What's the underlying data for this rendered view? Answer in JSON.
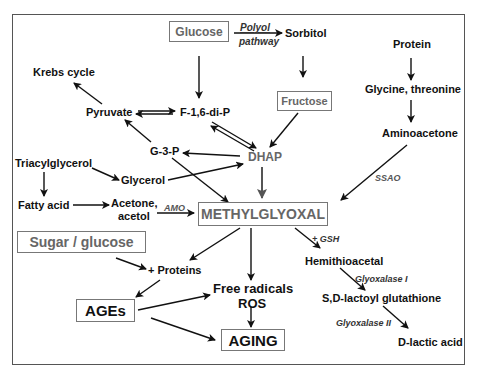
{
  "diagram": {
    "nodes": {
      "glucose": "Glucose",
      "polyol": "Polyol",
      "pathway": "pathway",
      "sorbitol": "Sorbitol",
      "protein": "Protein",
      "krebs": "Krebs cycle",
      "pyruvate": "Pyruvate",
      "f16dip": "F-1,6-di-P",
      "glycine": "Glycine, threonine",
      "fructose": "Fructose",
      "aminoacetone": "Aminoacetone",
      "g3p": "G-3-P",
      "dhap": "DHAP",
      "triacylglycerol": "Triacylglycerol",
      "glycerol": "Glycerol",
      "ssao": "SSAO",
      "fatty_acid": "Fatty acid",
      "acetone": "Acetone,",
      "acetol": "acetol",
      "amo": "AMO",
      "methylglyoxal": "METHYLGLYOXAL",
      "gsh": "+ GSH",
      "sugar_glucose": "Sugar / glucose",
      "hemithioacetal": "Hemithioacetal",
      "proteins": "+ Proteins",
      "free_radicals": "Free radicals",
      "ros": "ROS",
      "glyoxalase1": "Glyoxalase I",
      "ages": "AGEs",
      "sd_lactoyl": "S,D-lactoyl glutathione",
      "glyoxalase2": "Glyoxalase II",
      "aging": "AGING",
      "d_lactic": "D-lactic acid"
    },
    "colors": {
      "text": "#111111",
      "gray_text": "#666666",
      "border": "#777777",
      "arrow": "#111111"
    }
  }
}
